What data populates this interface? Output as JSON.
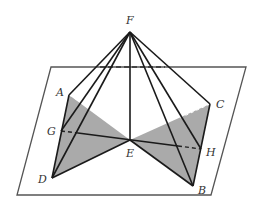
{
  "figure": {
    "type": "geometry-diagram",
    "colors": {
      "line": "#1a1a1a",
      "plane": "#555555",
      "shade": "#aaaaaa"
    },
    "points": {
      "F": {
        "label": "F",
        "x": 130,
        "y": 32
      },
      "A": {
        "label": "A",
        "x": 69,
        "y": 95
      },
      "C": {
        "label": "C",
        "x": 210,
        "y": 104
      },
      "G": {
        "label": "G",
        "x": 61,
        "y": 131
      },
      "E": {
        "label": "E",
        "x": 130,
        "y": 140
      },
      "H": {
        "label": "H",
        "x": 201,
        "y": 149
      },
      "D": {
        "label": "D",
        "x": 52,
        "y": 178
      },
      "B": {
        "label": "B",
        "x": 193,
        "y": 186
      }
    },
    "labels": [
      "F",
      "A",
      "C",
      "G",
      "E",
      "H",
      "D",
      "B"
    ]
  }
}
